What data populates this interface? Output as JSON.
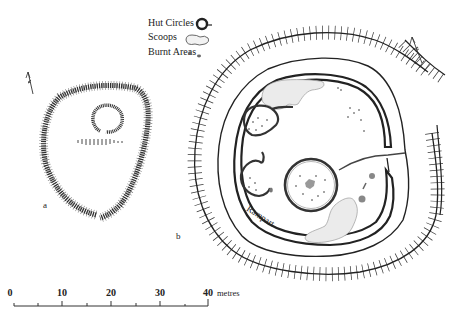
{
  "legend": {
    "items": [
      {
        "label": "Hut Circles",
        "symbol": "hut-circle-symbol"
      },
      {
        "label": "Scoops",
        "symbol": "scoop-symbol"
      },
      {
        "label": "Burnt Areas",
        "symbol": "burnt-area-symbol"
      }
    ]
  },
  "plans": {
    "a": {
      "label": "a"
    },
    "b": {
      "label": "b",
      "rampart_label": "Rampart"
    }
  },
  "scale_bar": {
    "ticks": [
      "0",
      "10",
      "20",
      "30",
      "40"
    ],
    "unit": "metres"
  },
  "colors": {
    "ink": "#222222",
    "scoop_fill": "#e6e6e6",
    "burnt": "#777777",
    "background": "#ffffff"
  }
}
